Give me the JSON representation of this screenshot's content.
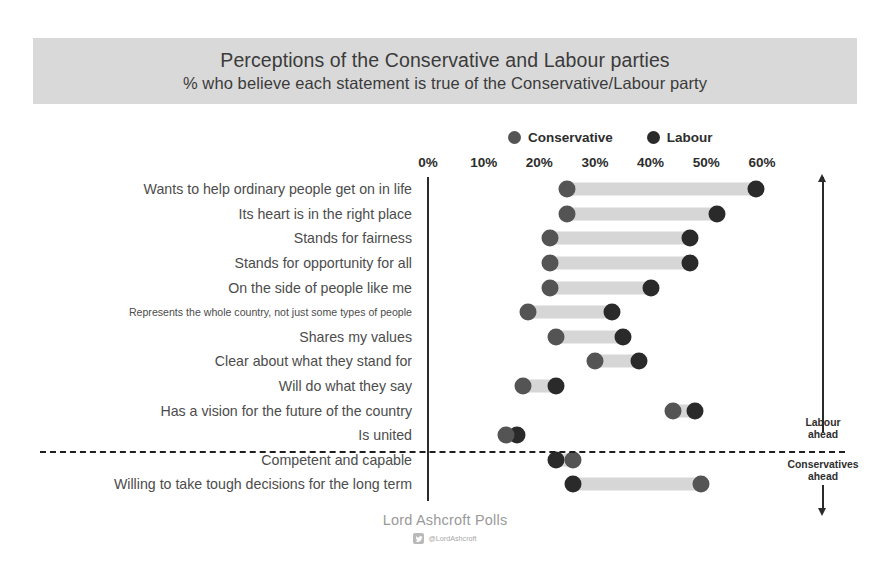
{
  "header": {
    "title_line1": "Perceptions of the Conservative and Labour parties",
    "title_line2": "% who believe each statement is true of the Conservative/Labour party",
    "banner_color": "#d9d9d9"
  },
  "legend": {
    "items": [
      {
        "label": "Conservative",
        "color": "#545454",
        "icon": "filled-circle-icon"
      },
      {
        "label": "Labour",
        "color": "#2a2a2a",
        "icon": "filled-circle-icon"
      }
    ]
  },
  "annotations": {
    "labour_ahead": "Labour\nahead",
    "labour_ahead_line1": "Labour",
    "labour_ahead_line2": "ahead",
    "conservatives_ahead_line1": "Conservatives",
    "conservatives_ahead_line2": "ahead",
    "arrow_up": "arrow-up-icon",
    "arrow_down": "arrow-down-icon"
  },
  "footer": {
    "source": "Lord Ashcroft Polls",
    "handle": "@LordAshcroft",
    "handle_icon": "twitter-icon"
  },
  "chart_data": {
    "type": "dot",
    "title": "Perceptions of the Conservative and Labour parties",
    "subtitle": "% who believe each statement is true of the Conservative/Labour party",
    "xlabel": "",
    "ylabel": "",
    "xlim": [
      0,
      62
    ],
    "grid": false,
    "legend_position": "top-center",
    "tick_values": [
      0,
      10,
      20,
      30,
      40,
      50,
      60
    ],
    "tick_labels": [
      "0%",
      "10%",
      "20%",
      "30%",
      "40%",
      "50%",
      "60%"
    ],
    "categories": [
      "Wants to help ordinary people get on in life",
      "Its heart is in the right place",
      "Stands for fairness",
      "Stands for opportunity for all",
      "On the side of people like me",
      "Represents the whole country, not just some types of people",
      "Shares my values",
      "Clear about what they stand for",
      "Will do what they say",
      "Has a vision for the future of the country",
      "Is united",
      "Competent and capable",
      "Willing to take tough decisions for the long term"
    ],
    "series": [
      {
        "name": "Conservative",
        "color": "#545454",
        "values": [
          25,
          25,
          22,
          22,
          22,
          18,
          23,
          30,
          17,
          44,
          14,
          26,
          49
        ]
      },
      {
        "name": "Labour",
        "color": "#2a2a2a",
        "values": [
          59,
          52,
          47,
          47,
          40,
          33,
          35,
          38,
          23,
          48,
          16,
          23,
          26
        ]
      }
    ],
    "divider_after_category_index": 10,
    "divider_note_above": "Labour ahead",
    "divider_note_below": "Conservatives ahead",
    "small_label_indices": [
      5
    ]
  }
}
